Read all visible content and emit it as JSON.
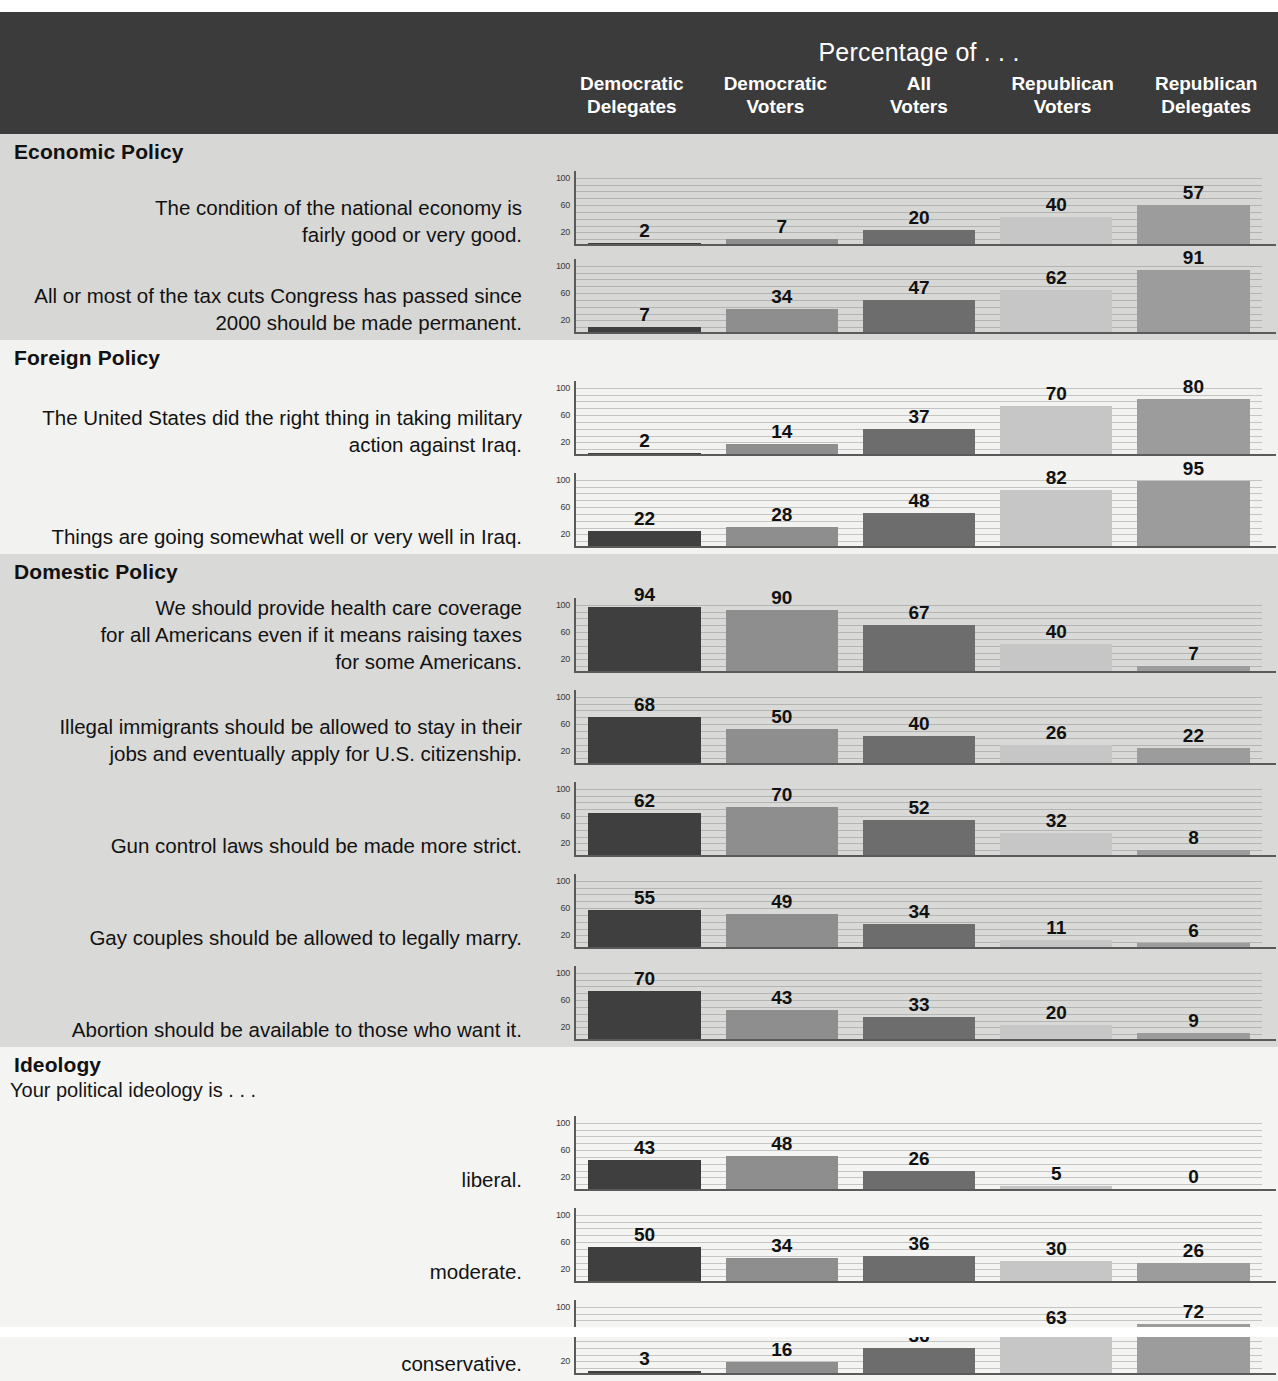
{
  "header": {
    "title": "Percentage of . . .",
    "columns": [
      {
        "line1": "Democratic",
        "line2": "Delegates"
      },
      {
        "line1": "Democratic",
        "line2": "Voters"
      },
      {
        "line1": "All",
        "line2": "Voters"
      },
      {
        "line1": "Republican",
        "line2": "Voters"
      },
      {
        "line1": "Republican",
        "line2": "Delegates"
      }
    ]
  },
  "axis": {
    "ticks": [
      "100",
      "60",
      "20"
    ]
  },
  "colors": {
    "header_band": "#3b3b3b",
    "democratic_delegates": "#3f3f3f",
    "democratic_voters": "#8e8e8e",
    "all_voters": "#6d6d6d",
    "republican_voters": "#c6c6c6",
    "republican_delegates": "#9c9c9c",
    "section_shaded": "#d8d8d6",
    "section_light": "#f2f2f0"
  },
  "sections": [
    {
      "id": "economic-policy",
      "title": "Economic Policy",
      "shade": "dark",
      "lead_in": null,
      "rows": [
        {
          "label": [
            "The condition of the national economy is",
            "fairly good or very good."
          ],
          "values": [
            2,
            7,
            20,
            40,
            57
          ]
        },
        {
          "label": [
            "All or most of the tax cuts Congress has passed since",
            "2000 should be made permanent."
          ],
          "values": [
            7,
            34,
            47,
            62,
            91
          ]
        }
      ]
    },
    {
      "id": "foreign-policy",
      "title": "Foreign Policy",
      "shade": "light",
      "lead_in": null,
      "rows": [
        {
          "label": [
            "The United States did the right thing in taking military",
            "action against Iraq."
          ],
          "values": [
            2,
            14,
            37,
            70,
            80
          ]
        },
        {
          "label": [
            "Things are going somewhat well or very well in Iraq."
          ],
          "values": [
            22,
            28,
            48,
            82,
            95
          ]
        }
      ]
    },
    {
      "id": "domestic-policy",
      "title": "Domestic Policy",
      "shade": "dark",
      "lead_in": null,
      "rows": [
        {
          "label": [
            "We should provide health care coverage",
            "for all Americans even if it means raising taxes",
            "for some Americans."
          ],
          "values": [
            94,
            90,
            67,
            40,
            7
          ]
        },
        {
          "label": [
            "Illegal immigrants should be allowed to stay in their",
            "jobs and eventually apply for U.S. citizenship."
          ],
          "values": [
            68,
            50,
            40,
            26,
            22
          ]
        },
        {
          "label": [
            "Gun control laws should be made more strict."
          ],
          "values": [
            62,
            70,
            52,
            32,
            8
          ]
        },
        {
          "label": [
            "Gay couples should be allowed to legally marry."
          ],
          "values": [
            55,
            49,
            34,
            11,
            6
          ]
        },
        {
          "label": [
            "Abortion should be available to those who want it."
          ],
          "values": [
            70,
            43,
            33,
            20,
            9
          ]
        }
      ]
    },
    {
      "id": "ideology",
      "title": "Ideology",
      "shade": "light",
      "lead_in": "Your political ideology is . . .",
      "rows": [
        {
          "label": [
            "liberal."
          ],
          "values": [
            43,
            48,
            26,
            5,
            0
          ]
        },
        {
          "label": [
            "moderate."
          ],
          "values": [
            50,
            34,
            36,
            30,
            26
          ]
        },
        {
          "label": [
            "conservative."
          ],
          "values": [
            3,
            16,
            36,
            63,
            72
          ]
        }
      ]
    }
  ],
  "chart_data": {
    "type": "bar",
    "title": "Percentage of . . .",
    "xlabel": "",
    "ylabel": "Percentage",
    "ylim": [
      0,
      110
    ],
    "yticks": [
      20,
      60,
      100
    ],
    "grid": true,
    "legend": "none",
    "categories": [
      "Democratic Delegates",
      "Democratic Voters",
      "All Voters",
      "Republican Voters",
      "Republican Delegates"
    ],
    "series": [
      {
        "name": "The condition of the national economy is fairly good or very good.",
        "group": "Economic Policy",
        "values": [
          2,
          7,
          20,
          40,
          57
        ]
      },
      {
        "name": "All or most of the tax cuts Congress has passed since 2000 should be made permanent.",
        "group": "Economic Policy",
        "values": [
          7,
          34,
          47,
          62,
          91
        ]
      },
      {
        "name": "The United States did the right thing in taking military action against Iraq.",
        "group": "Foreign Policy",
        "values": [
          2,
          14,
          37,
          70,
          80
        ]
      },
      {
        "name": "Things are going somewhat well or very well in Iraq.",
        "group": "Foreign Policy",
        "values": [
          22,
          28,
          48,
          82,
          95
        ]
      },
      {
        "name": "We should provide health care coverage for all Americans even if it means raising taxes for some Americans.",
        "group": "Domestic Policy",
        "values": [
          94,
          90,
          67,
          40,
          7
        ]
      },
      {
        "name": "Illegal immigrants should be allowed to stay in their jobs and eventually apply for U.S. citizenship.",
        "group": "Domestic Policy",
        "values": [
          68,
          50,
          40,
          26,
          22
        ]
      },
      {
        "name": "Gun control laws should be made more strict.",
        "group": "Domestic Policy",
        "values": [
          62,
          70,
          52,
          32,
          8
        ]
      },
      {
        "name": "Gay couples should be allowed to legally marry.",
        "group": "Domestic Policy",
        "values": [
          55,
          49,
          34,
          11,
          6
        ]
      },
      {
        "name": "Abortion should be available to those who want it.",
        "group": "Domestic Policy",
        "values": [
          70,
          43,
          33,
          20,
          9
        ]
      },
      {
        "name": "Your political ideology is . . . liberal.",
        "group": "Ideology",
        "values": [
          43,
          48,
          26,
          5,
          0
        ]
      },
      {
        "name": "Your political ideology is . . . moderate.",
        "group": "Ideology",
        "values": [
          50,
          34,
          36,
          30,
          26
        ]
      },
      {
        "name": "Your political ideology is . . . conservative.",
        "group": "Ideology",
        "values": [
          3,
          16,
          36,
          63,
          72
        ]
      }
    ]
  }
}
